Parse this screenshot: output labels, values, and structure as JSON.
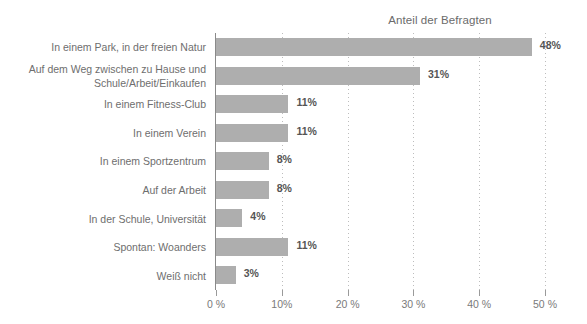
{
  "chart_data": {
    "type": "bar",
    "orientation": "horizontal",
    "title": "Anteil der Befragten",
    "xlabel": "",
    "ylabel": "",
    "xlim": [
      0,
      50
    ],
    "grid": true,
    "legend": "none",
    "categories": [
      "In einem Park, in der freien Natur",
      "Auf dem Weg zwischen zu Hause und\nSchule/Arbeit/Einkaufen",
      "In einem Fitness-Club",
      "In einem Verein",
      "In einem Sportzentrum",
      "Auf der Arbeit",
      "In der Schule, Universität",
      "Spontan: Woanders",
      "Weiß nicht"
    ],
    "values": [
      48,
      31,
      11,
      11,
      8,
      8,
      4,
      11,
      3
    ],
    "data_labels": [
      "48%",
      "31%",
      "11%",
      "11%",
      "8%",
      "8%",
      "4%",
      "11%",
      "3%"
    ],
    "xticks": [
      0,
      10,
      20,
      30,
      40,
      50
    ],
    "xtick_labels": [
      "0 %",
      "10%",
      "20 %",
      "30 %",
      "40 %",
      "50 %"
    ],
    "colors": {
      "bar": "#aeaeae",
      "axis": "#8a8a8a",
      "grid": "#bdbdbd",
      "text": "#6e6e6e",
      "value_text": "#555555",
      "background": "#ffffff"
    }
  }
}
